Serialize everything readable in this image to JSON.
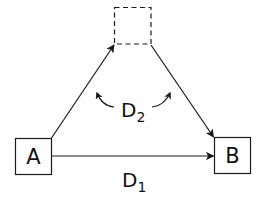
{
  "diagram": {
    "type": "flow-triangle",
    "stroke_color": "#1a1a1a",
    "background": "#ffffff",
    "nodes": {
      "a": {
        "label": "A",
        "style": "solid-box"
      },
      "b": {
        "label": "B",
        "style": "solid-box"
      },
      "intermediate": {
        "label": "",
        "style": "dashed-box"
      }
    },
    "edges": [
      {
        "from": "A",
        "to": "intermediate",
        "style": "arrow"
      },
      {
        "from": "intermediate",
        "to": "B",
        "style": "arrow"
      },
      {
        "from": "A",
        "to": "B",
        "style": "arrow"
      }
    ],
    "labels": {
      "d1": {
        "main": "D",
        "subscript": "1"
      },
      "d2": {
        "main": "D",
        "subscript": "2"
      }
    }
  }
}
